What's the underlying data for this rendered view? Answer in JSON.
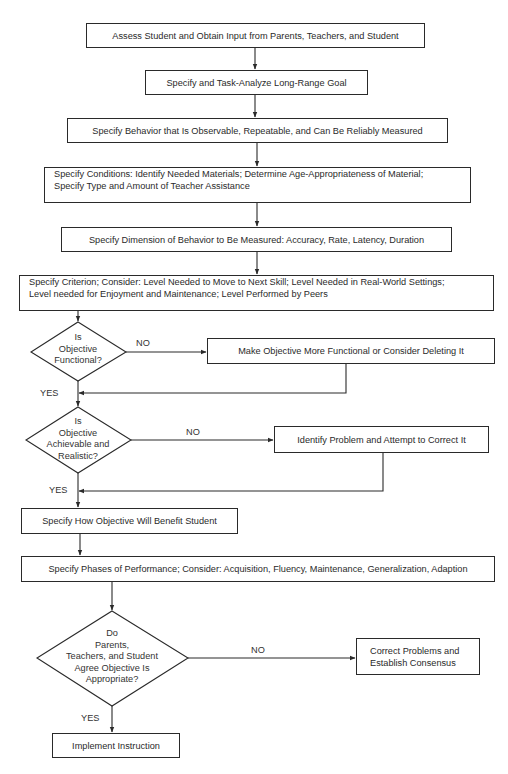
{
  "header_fragment": "",
  "nodes": {
    "assess": "Assess Student and Obtain Input from Parents, Teachers, and Student",
    "long_range": "Specify and Task-Analyze Long-Range Goal",
    "behavior": "Specify Behavior that Is Observable, Repeatable, and Can Be Reliably Measured",
    "conditions_line1": "Specify Conditions: Identify Needed Materials; Determine Age-Appropriateness of Material;",
    "conditions_line2": "Specify Type and Amount of Teacher Assistance",
    "dimension": "Specify Dimension of Behavior to Be Measured: Accuracy, Rate, Latency, Duration",
    "criterion_line1": "Specify Criterion; Consider: Level Needed to Move to Next Skill; Level Needed in Real-World Settings;",
    "criterion_line2": "Level needed for Enjoyment and Maintenance; Level Performed by Peers",
    "make_functional": "Make Objective More Functional or Consider Deleting It",
    "identify_problem": "Identify Problem and Attempt to Correct It",
    "benefit": "Specify How Objective Will Benefit Student",
    "phases": "Specify Phases of Performance; Consider: Acquisition, Fluency, Maintenance, Generalization, Adaption",
    "correct_line1": "Correct Problems and",
    "correct_line2": "Establish Consensus",
    "implement": "Implement Instruction"
  },
  "decisions": {
    "functional": [
      "Is",
      "Objective",
      "Functional?"
    ],
    "achievable": [
      "Is",
      "Objective",
      "Achievable and",
      "Realistic?"
    ],
    "agree": [
      "Do",
      "Parents,",
      "Teachers, and Student",
      "Agree Objective Is",
      "Appropriate?"
    ]
  },
  "edge_labels": {
    "no": "NO",
    "yes": "YES"
  },
  "colors": {
    "ink": "#2a2a2a",
    "background": "#ffffff"
  }
}
